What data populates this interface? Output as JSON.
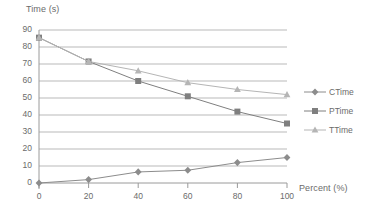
{
  "chart_data": {
    "type": "line",
    "title": "",
    "xlabel": "Percent (%)",
    "ylabel": "Time (s)",
    "x": [
      0,
      20,
      40,
      60,
      80,
      100
    ],
    "xlim": [
      0,
      100
    ],
    "ylim": [
      0,
      90
    ],
    "xticks": [
      "0",
      "20",
      "40",
      "60",
      "80",
      "100"
    ],
    "yticks": [
      "0",
      "10",
      "20",
      "30",
      "40",
      "50",
      "60",
      "70",
      "80",
      "90"
    ],
    "grid": true,
    "legend_position": "right",
    "series": [
      {
        "name": "CTime",
        "marker": "diamond",
        "color": "#8c8c8c",
        "values": [
          0,
          2,
          6.5,
          7.5,
          12,
          15
        ]
      },
      {
        "name": "PTime",
        "marker": "square",
        "color": "#7f7f7f",
        "values": [
          85.5,
          71.5,
          60,
          51,
          42,
          35
        ]
      },
      {
        "name": "TTime",
        "marker": "triangle",
        "color": "#b5b5b5",
        "values": [
          85.5,
          71.5,
          66,
          59,
          55,
          52
        ]
      }
    ]
  },
  "axes": {
    "y_title": "Time (s)",
    "x_title": "Percent (%)"
  },
  "colors": {
    "gridline": "#b9b9b9",
    "axis": "#9a9a9a",
    "text": "#6b6b6b",
    "plot_background": "#ffffff"
  }
}
